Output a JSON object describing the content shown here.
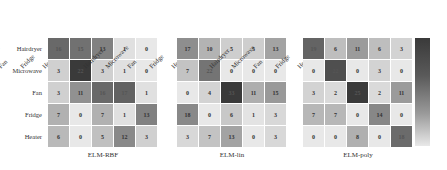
{
  "chart_data": [
    {
      "type": "heatmap",
      "title": "ELM-RBF",
      "xlabels": [
        "Hairdryer",
        "Microwave",
        "Fan",
        "Fridge",
        "Heater"
      ],
      "ylabels": [
        "Hairdryer",
        "Microwave",
        "Fan",
        "Fridge",
        "Heater"
      ],
      "values": [
        [
          16,
          15,
          13,
          1,
          0
        ],
        [
          3,
          22,
          3,
          1,
          0
        ],
        [
          3,
          11,
          16,
          17,
          1
        ],
        [
          7,
          0,
          7,
          1,
          13
        ],
        [
          6,
          0,
          5,
          12,
          3
        ]
      ]
    },
    {
      "type": "heatmap",
      "title": "ELM-lin",
      "xlabels": [
        "Hairdryer",
        "Microwave",
        "Fan",
        "Fridge",
        "Heater"
      ],
      "ylabels": [
        "Hairdryer",
        "Microwave",
        "Fan",
        "Fridge",
        "Heater"
      ],
      "values": [
        [
          17,
          10,
          5,
          5,
          13
        ],
        [
          7,
          22,
          0,
          0,
          0
        ],
        [
          0,
          4,
          33,
          11,
          15
        ],
        [
          18,
          0,
          6,
          1,
          3
        ],
        [
          3,
          7,
          13,
          0,
          3
        ]
      ]
    },
    {
      "type": "heatmap",
      "title": "ELM-poly",
      "xlabels": [
        "Hairdryer",
        "Microwave",
        "Fan",
        "Fridge",
        "Heater"
      ],
      "ylabels": [
        "Hairdryer",
        "Microwave",
        "Fan",
        "Fridge",
        "Heater"
      ],
      "values": [
        [
          19,
          6,
          11,
          6,
          3
        ],
        [
          0,
          22,
          0,
          3,
          0
        ],
        [
          3,
          2,
          25,
          2,
          11
        ],
        [
          7,
          7,
          0,
          14,
          0
        ],
        [
          0,
          0,
          8,
          0,
          18
        ]
      ]
    }
  ],
  "colorbar": {
    "colors": [
      "#3a3a3a",
      "#e8e8e8"
    ]
  }
}
